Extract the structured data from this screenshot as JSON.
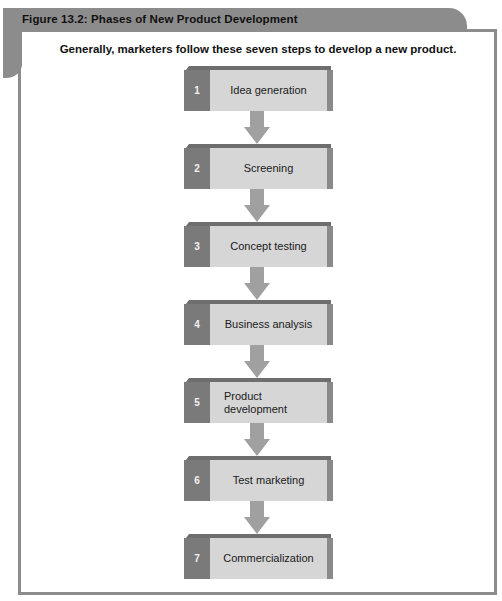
{
  "figure": {
    "title": "Figure 13.2: Phases of New Product Development",
    "subtitle": "Generally, marketers follow these seven steps to develop a new product."
  },
  "colors": {
    "frame": "#8c8c8c",
    "number_tab": "#7a7a7a",
    "step_body": "#d6d6d6",
    "arrow": "#a0a0a0"
  },
  "steps": [
    {
      "number": "1",
      "label": "Idea generation"
    },
    {
      "number": "2",
      "label": "Screening"
    },
    {
      "number": "3",
      "label": "Concept testing"
    },
    {
      "number": "4",
      "label": "Business analysis"
    },
    {
      "number": "5",
      "label_line1": "Product",
      "label_line2": "development"
    },
    {
      "number": "6",
      "label": "Test marketing"
    },
    {
      "number": "7",
      "label": "Commercialization"
    }
  ]
}
